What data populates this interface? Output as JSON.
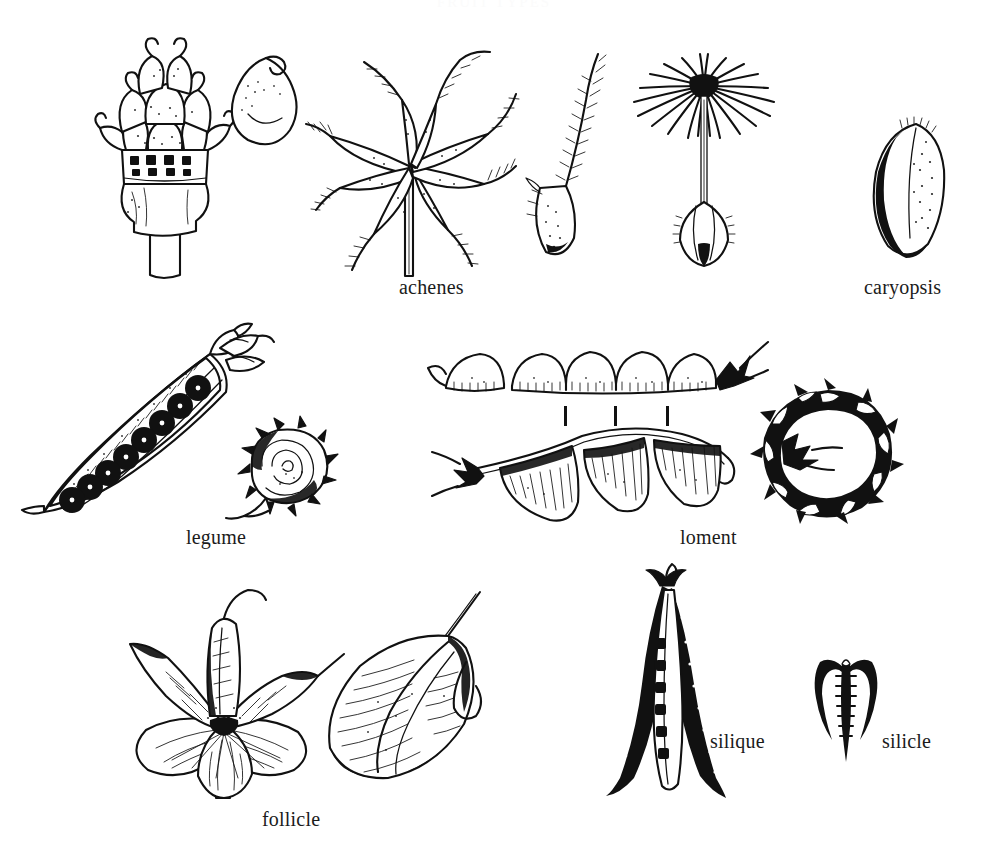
{
  "plate": {
    "title": "FRUIT TYPES",
    "background_color": "#ffffff",
    "ink_color": "#111111",
    "width": 988,
    "height": 865
  },
  "captions": {
    "achenes": "achenes",
    "caryopsis": "caryopsis",
    "legume": "legume",
    "loment": "loment",
    "follicle": "follicle",
    "silique": "silique",
    "silicle": "silicle"
  },
  "figures": [
    {
      "id": "bur-achene-cluster",
      "caption_ref": "achenes",
      "description": "Bur-like achene head with hooked bracts on a thick stalk",
      "row": 1
    },
    {
      "id": "teardrop-achene",
      "caption_ref": "achenes",
      "description": "Single smooth teardrop-shaped achene seed",
      "row": 1
    },
    {
      "id": "plumed-achene-star",
      "caption_ref": "achenes",
      "description": "Star cluster of achenes with long feathery awns",
      "row": 1
    },
    {
      "id": "single-plumed-achene",
      "caption_ref": "achenes",
      "description": "Detached achene with one feathery awn",
      "row": 1
    },
    {
      "id": "pappus-achene",
      "caption_ref": "achenes",
      "description": "Dandelion achene with radiating pappus parachute",
      "row": 1
    },
    {
      "id": "caryopsis-grain",
      "caption_ref": "caryopsis",
      "description": "Elongate grass grain, shaded along one margin",
      "row": 1
    },
    {
      "id": "pea-pod-legume",
      "caption_ref": "legume",
      "description": "Split pea pod showing eight dark round seeds",
      "row": 2
    },
    {
      "id": "spiral-spiny-legume",
      "caption_ref": "legume",
      "description": "Coiled spiny legume pod",
      "row": 2
    },
    {
      "id": "segmented-loment",
      "caption_ref": "loment",
      "description": "Loment with four constricted segments and division marks",
      "row": 2
    },
    {
      "id": "scalloped-loment",
      "caption_ref": "loment",
      "description": "Loment in side view with three deep scalloped lobes",
      "row": 2
    },
    {
      "id": "ring-spiny-loment",
      "caption_ref": "loment",
      "description": "Ring-shaped spiny loment in dark silhouette",
      "row": 2
    },
    {
      "id": "follicle-cluster",
      "caption_ref": "follicle",
      "description": "Whorl of five beaked follicles on a single stalk",
      "row": 3
    },
    {
      "id": "single-follicle",
      "caption_ref": "follicle",
      "description": "Single inflated follicle with long beak",
      "row": 3
    },
    {
      "id": "silique-pod",
      "caption_ref": "silique",
      "description": "Long narrow silique opened to show seeds on septum",
      "row": 3
    },
    {
      "id": "silicle-pod",
      "caption_ref": "silicle",
      "description": "Short silicle with two splayed valves and central septum",
      "row": 3
    }
  ],
  "loment_segment_marks": 3,
  "pea_seed_count": 8,
  "pappus_bristle_count": 22,
  "follicle_lobe_count": 5
}
